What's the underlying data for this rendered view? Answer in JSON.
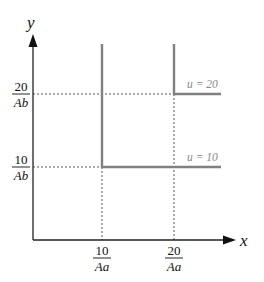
{
  "diagram": {
    "axes": {
      "x_label": "x",
      "y_label": "y",
      "x_ticks": [
        {
          "numerator": "10",
          "denominator": "Aa"
        },
        {
          "numerator": "20",
          "denominator": "Aa"
        }
      ],
      "y_ticks": [
        {
          "numerator": "20",
          "denominator": "Ab"
        },
        {
          "numerator": "10",
          "denominator": "Ab"
        }
      ]
    },
    "curves": [
      {
        "label": "u = 20",
        "type": "L-shaped indifference curve",
        "corner": [
          "20/Aa",
          "20/Ab"
        ]
      },
      {
        "label": "u = 10",
        "type": "L-shaped indifference curve",
        "corner": [
          "10/Aa",
          "10/Ab"
        ]
      }
    ],
    "colors": {
      "axis": "#222222",
      "curve": "#808080",
      "dashed": "#555555",
      "curve_label": "#888888"
    }
  }
}
